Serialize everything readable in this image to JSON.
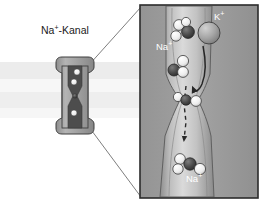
{
  "figure": {
    "title_label": "Na",
    "title_sup": "+",
    "title_rest": "-Kanal",
    "background_color": "#ffffff",
    "membrane": {
      "band_color_outer": "#ebebeb",
      "band_color_inner": "#f4f4f4",
      "band_top_y": 62,
      "band_bottom_y": 118
    }
  },
  "left_panel": {
    "channel": {
      "body_color": "#9a9a9a",
      "body_light": "#b5b5b5",
      "pore_color": "#4a4a4a",
      "outline_color": "#3c3c3c",
      "ions_in_pore": 3
    },
    "connector_lines": {
      "color": "#6b6b6b",
      "count": 2
    }
  },
  "right_panel": {
    "border_color": "#2b2b2b",
    "background_color": "#9c9c9c",
    "x": 140,
    "y": 5,
    "width": 118,
    "height": 193,
    "funnel": {
      "fill_light": "#cfcfcf",
      "fill_mid": "#b0b0b0",
      "fill_shadow": "#8c8c8c",
      "outline": "#5a5a5a"
    },
    "labels": [
      {
        "name": "k-plus-label",
        "text": "K",
        "sup": "+",
        "x": 214,
        "y": 20,
        "color": "#ffffff"
      },
      {
        "name": "na-plus-label-top",
        "text": "Na",
        "sup": "+",
        "x": 165,
        "y": 50,
        "color": "#ffffff"
      },
      {
        "name": "na-plus-label-bottom",
        "text": "Na",
        "sup": "+",
        "x": 192,
        "y": 182,
        "color": "#ffffff"
      }
    ],
    "ions": {
      "sodium_core_color": "#4e4e4e",
      "water_color": "#f2f2f2",
      "water_outline": "#4a4a4a",
      "potassium_color": "#a8a8a8",
      "potassium_outline": "#4a4a4a",
      "potassium_radius": 11
    },
    "arrows": {
      "rejection_arrow_color": "#2f2f2f",
      "permeation_arrow_color": "#2a2a2a",
      "permeation_arrow_style": "dashed"
    }
  }
}
